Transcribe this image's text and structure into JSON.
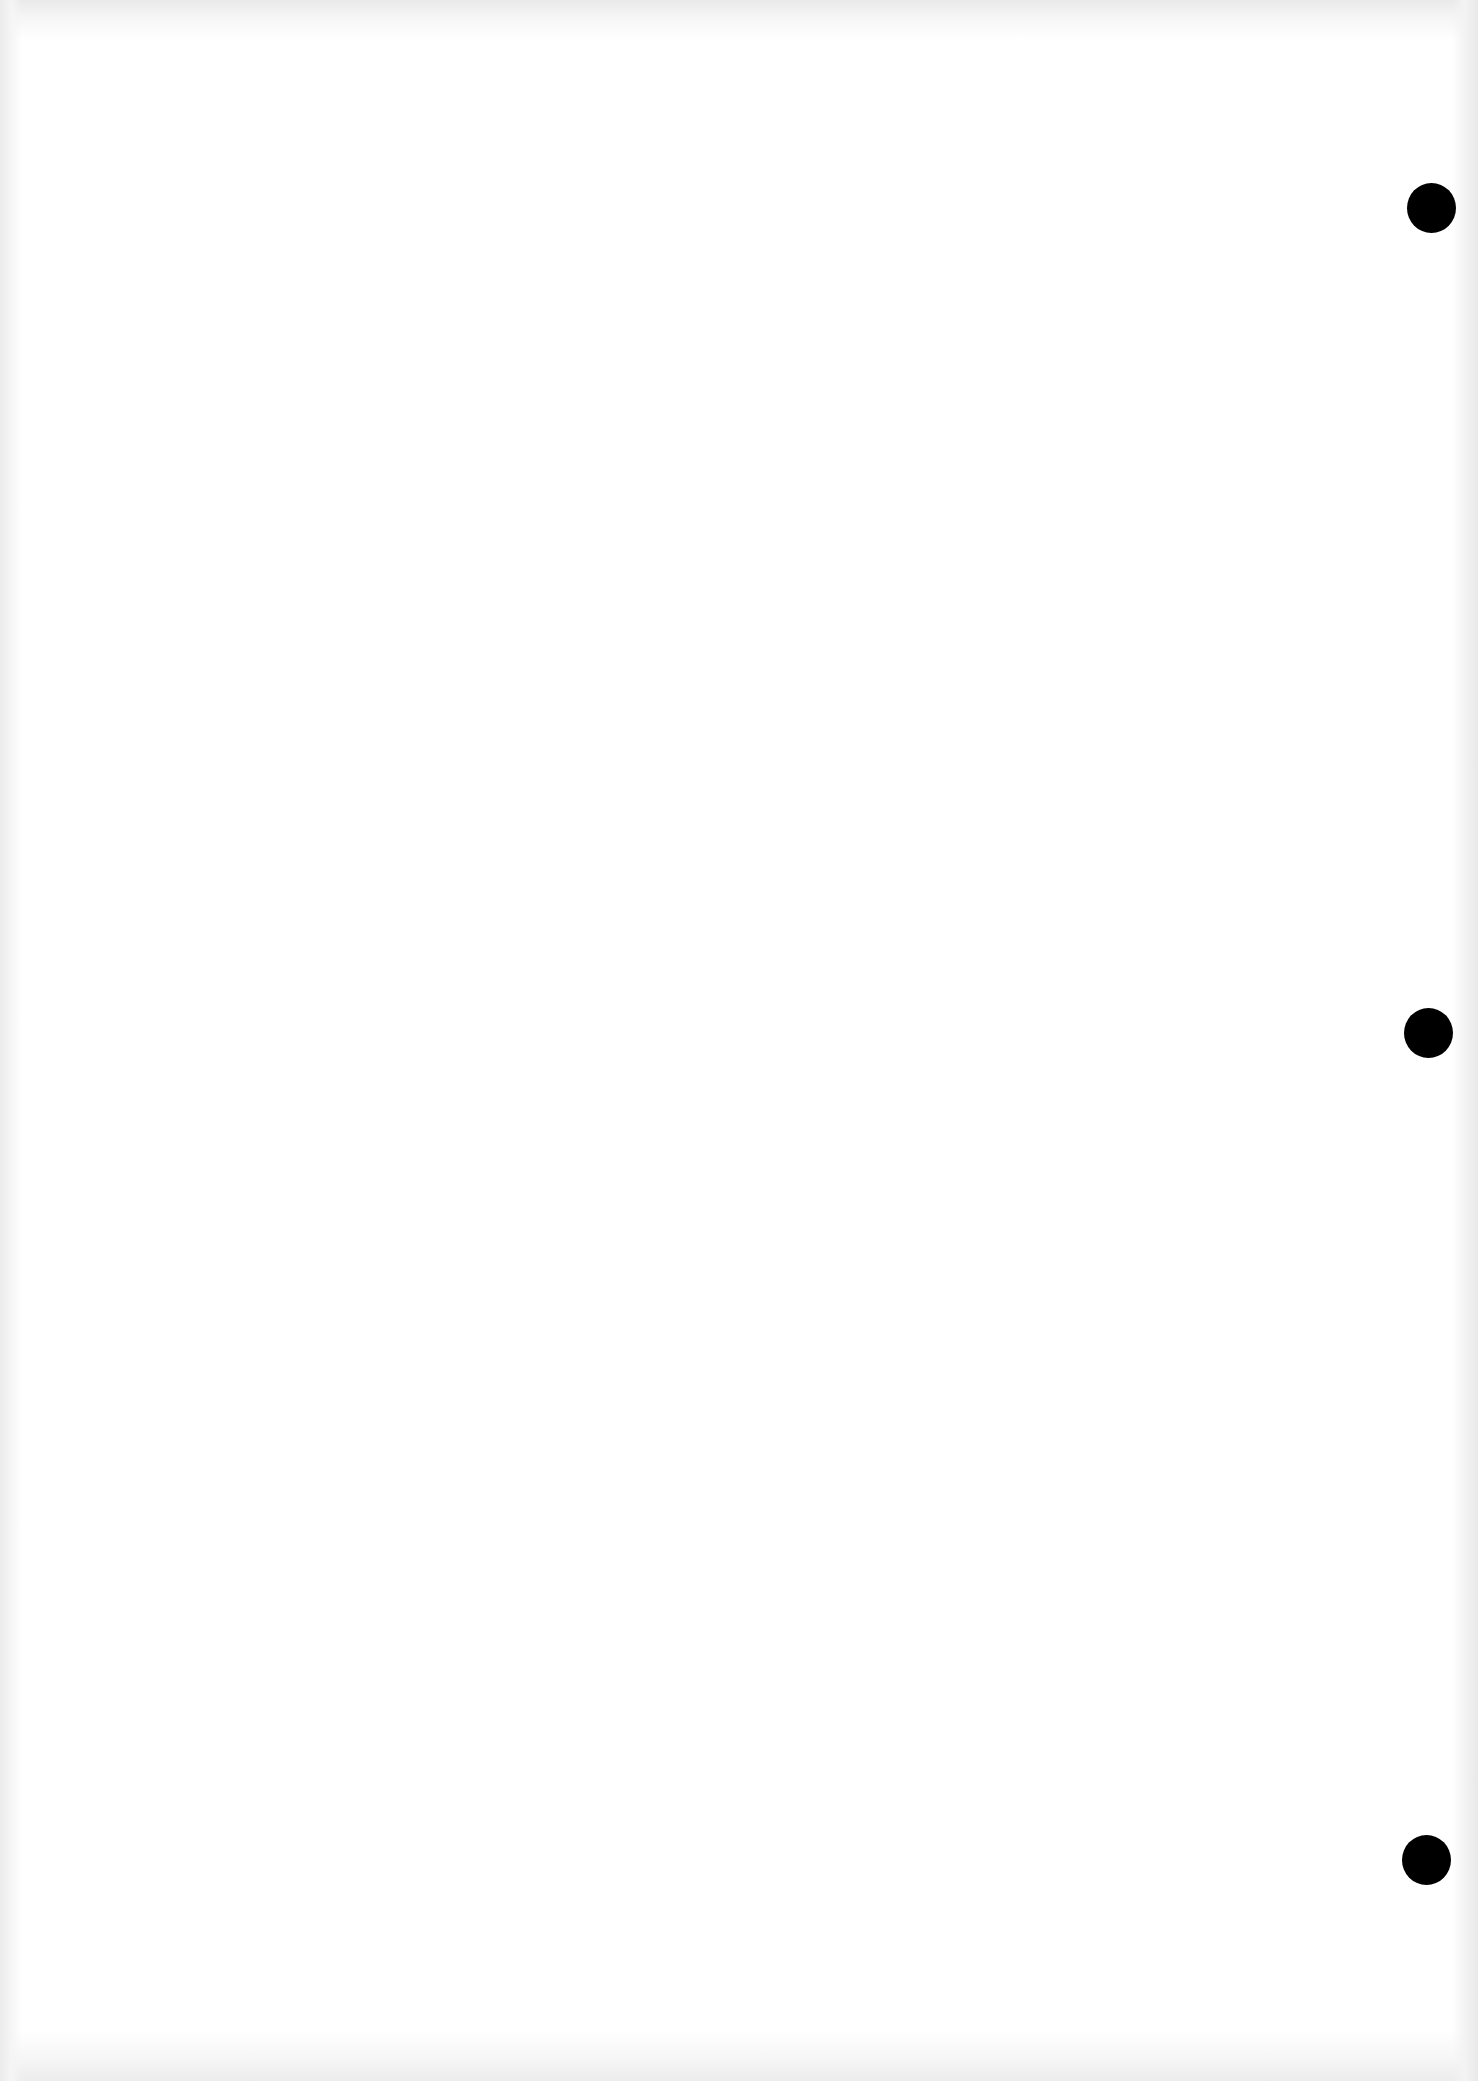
{
  "document": {
    "type": "blank-scanned-page",
    "background_color": "#ffffff",
    "text_content": "",
    "punch_holes": [
      {
        "position": "right-top",
        "color": "#000000"
      },
      {
        "position": "right-middle",
        "color": "#000000"
      },
      {
        "position": "right-bottom",
        "color": "#000000"
      }
    ]
  }
}
